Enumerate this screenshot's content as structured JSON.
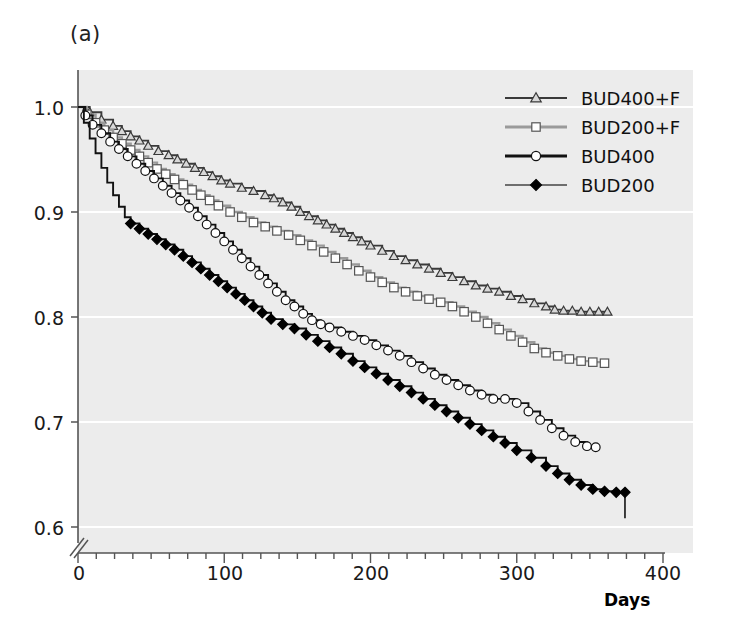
{
  "panel": {
    "label": "(a)"
  },
  "chart_data": {
    "type": "line",
    "title": "",
    "subtitle": "",
    "xlabel": "Days",
    "ylabel": "",
    "xlim": [
      0,
      400
    ],
    "ylim": [
      0.6,
      1.0
    ],
    "y_axis_break": true,
    "grid": "horizontal-white",
    "xticks": [
      0,
      100,
      200,
      300,
      400
    ],
    "xtick_labels": [
      "0",
      "100",
      "200",
      "300",
      "400"
    ],
    "xminor_interval": 12.5,
    "yticks": [
      0.6,
      0.7,
      0.8,
      0.9,
      1.0
    ],
    "ytick_labels": [
      "0.6",
      "0.7",
      "0.8",
      "0.9",
      "1.0"
    ],
    "legend_position": "top-right",
    "plot_background": "#ececec",
    "series": [
      {
        "name": "BUD400+F",
        "marker": "open-triangle",
        "line_color": "#3a3a3a",
        "marker_fill": "#d8d8d8",
        "marker_edge": "#3a3a3a",
        "x": [
          0,
          8,
          16,
          24,
          30,
          36,
          42,
          48,
          55,
          62,
          68,
          74,
          80,
          86,
          92,
          98,
          104,
          112,
          120,
          128,
          134,
          140,
          146,
          152,
          158,
          164,
          170,
          176,
          182,
          188,
          194,
          200,
          208,
          216,
          224,
          232,
          240,
          248,
          256,
          264,
          272,
          280,
          288,
          296,
          304,
          312,
          320,
          326,
          332,
          338,
          344,
          350,
          356,
          362
        ],
        "y": [
          1.0,
          0.995,
          0.988,
          0.982,
          0.977,
          0.972,
          0.968,
          0.963,
          0.958,
          0.954,
          0.95,
          0.946,
          0.942,
          0.938,
          0.934,
          0.93,
          0.927,
          0.923,
          0.92,
          0.916,
          0.913,
          0.909,
          0.905,
          0.9,
          0.896,
          0.892,
          0.888,
          0.884,
          0.88,
          0.876,
          0.872,
          0.868,
          0.863,
          0.858,
          0.854,
          0.85,
          0.846,
          0.842,
          0.838,
          0.834,
          0.83,
          0.827,
          0.824,
          0.82,
          0.817,
          0.813,
          0.81,
          0.807,
          0.806,
          0.806,
          0.805,
          0.805,
          0.805,
          0.805
        ],
        "end_value": 0.805
      },
      {
        "name": "BUD200+F",
        "marker": "open-square",
        "line_color": "#9a9a9a",
        "marker_fill": "#ffffff",
        "marker_edge": "#555555",
        "x": [
          0,
          6,
          12,
          18,
          24,
          30,
          36,
          42,
          48,
          54,
          60,
          66,
          72,
          78,
          84,
          90,
          96,
          104,
          112,
          120,
          128,
          136,
          144,
          152,
          160,
          168,
          176,
          184,
          192,
          200,
          208,
          216,
          224,
          232,
          240,
          248,
          256,
          264,
          272,
          280,
          288,
          296,
          304,
          312,
          320,
          328,
          336,
          344,
          352,
          360
        ],
        "y": [
          1.0,
          0.993,
          0.985,
          0.978,
          0.971,
          0.965,
          0.959,
          0.953,
          0.947,
          0.941,
          0.936,
          0.931,
          0.926,
          0.921,
          0.916,
          0.911,
          0.906,
          0.9,
          0.895,
          0.89,
          0.886,
          0.882,
          0.878,
          0.873,
          0.868,
          0.862,
          0.856,
          0.85,
          0.844,
          0.838,
          0.833,
          0.828,
          0.824,
          0.82,
          0.817,
          0.814,
          0.81,
          0.805,
          0.8,
          0.794,
          0.788,
          0.782,
          0.776,
          0.77,
          0.766,
          0.763,
          0.76,
          0.758,
          0.757,
          0.756
        ],
        "end_value": 0.756
      },
      {
        "name": "BUD400",
        "marker": "open-circle",
        "line_color": "#111111",
        "marker_fill": "#ffffff",
        "marker_edge": "#111111",
        "x": [
          0,
          5,
          10,
          16,
          22,
          28,
          34,
          40,
          46,
          52,
          58,
          64,
          70,
          76,
          82,
          88,
          94,
          100,
          106,
          112,
          118,
          124,
          130,
          136,
          142,
          148,
          154,
          160,
          166,
          172,
          180,
          188,
          196,
          204,
          212,
          220,
          228,
          236,
          244,
          252,
          260,
          268,
          276,
          284,
          292,
          300,
          308,
          316,
          324,
          332,
          340,
          348,
          354
        ],
        "y": [
          1.0,
          0.992,
          0.983,
          0.975,
          0.967,
          0.96,
          0.953,
          0.946,
          0.939,
          0.932,
          0.925,
          0.918,
          0.911,
          0.904,
          0.896,
          0.888,
          0.88,
          0.872,
          0.864,
          0.856,
          0.848,
          0.84,
          0.832,
          0.824,
          0.816,
          0.81,
          0.803,
          0.797,
          0.793,
          0.79,
          0.786,
          0.782,
          0.778,
          0.773,
          0.768,
          0.763,
          0.757,
          0.751,
          0.745,
          0.74,
          0.735,
          0.73,
          0.726,
          0.722,
          0.722,
          0.718,
          0.71,
          0.702,
          0.694,
          0.687,
          0.681,
          0.677,
          0.676
        ],
        "end_value": 0.676
      },
      {
        "name": "BUD200",
        "marker": "filled-diamond",
        "line_color": "#111111",
        "marker_fill": "#000000",
        "marker_edge": "#000000",
        "x": [
          0,
          4,
          8,
          12,
          16,
          20,
          24,
          28,
          32,
          36,
          42,
          48,
          54,
          60,
          66,
          72,
          78,
          84,
          90,
          96,
          102,
          108,
          114,
          120,
          126,
          132,
          140,
          148,
          156,
          164,
          172,
          180,
          188,
          196,
          204,
          212,
          220,
          228,
          236,
          244,
          252,
          260,
          268,
          276,
          284,
          292,
          300,
          310,
          320,
          328,
          336,
          344,
          352,
          360,
          368,
          374
        ],
        "y": [
          1.0,
          0.985,
          0.97,
          0.956,
          0.942,
          0.928,
          0.916,
          0.905,
          0.895,
          0.889,
          0.884,
          0.879,
          0.874,
          0.869,
          0.864,
          0.858,
          0.852,
          0.846,
          0.84,
          0.834,
          0.828,
          0.822,
          0.816,
          0.81,
          0.804,
          0.798,
          0.793,
          0.789,
          0.783,
          0.777,
          0.771,
          0.765,
          0.758,
          0.752,
          0.746,
          0.74,
          0.734,
          0.728,
          0.722,
          0.716,
          0.71,
          0.704,
          0.698,
          0.692,
          0.686,
          0.68,
          0.673,
          0.666,
          0.658,
          0.651,
          0.645,
          0.64,
          0.636,
          0.634,
          0.633,
          0.633
        ],
        "end_value": 0.633
      }
    ]
  },
  "legend": {
    "items": [
      {
        "label": "BUD400+F",
        "marker": "open-triangle",
        "line_color": "#3a3a3a"
      },
      {
        "label": "BUD200+F",
        "marker": "open-square",
        "line_color": "#9a9a9a"
      },
      {
        "label": "BUD400",
        "marker": "open-circle",
        "line_color": "#111111"
      },
      {
        "label": "BUD200",
        "marker": "filled-diamond",
        "line_color": "#6e6e6e"
      }
    ]
  },
  "axes": {
    "x_title": "Days",
    "ytick_labels": [
      "1.0",
      "0.9",
      "0.8",
      "0.7",
      "0.6"
    ],
    "xtick_labels": [
      "0",
      "100",
      "200",
      "300",
      "400"
    ]
  }
}
